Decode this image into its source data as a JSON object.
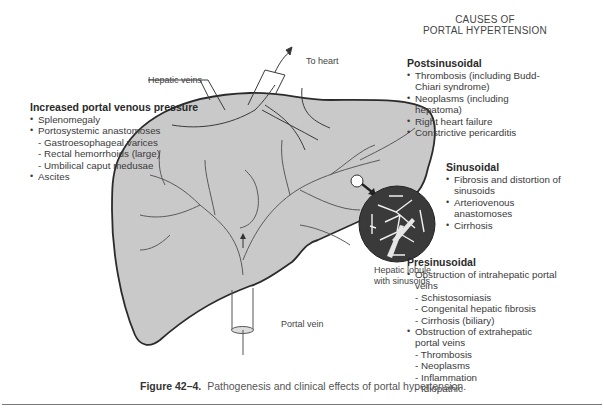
{
  "diagram": {
    "title_lines": [
      "CAUSES OF",
      "PORTAL HYPERTENSION"
    ],
    "labels": {
      "to_heart": "To heart",
      "hepatic_veins": "Hepatic veins",
      "portal_vein": "Portal vein",
      "hepatic_lobule_line1": "Hepatic lobule",
      "hepatic_lobule_line2": "with sinusoids"
    },
    "colors": {
      "liver_fill": "#c9c9c9",
      "liver_outline": "#2b2b2b",
      "vessel": "#555555",
      "lobule_fill": "#3a3a3a",
      "background": "#ffffff"
    }
  },
  "left_panel": {
    "heading": "Increased portal venous pressure",
    "items": [
      {
        "type": "bullet",
        "text": "Splenomegaly"
      },
      {
        "type": "bullet",
        "text": "Portosystemic anastomoses"
      },
      {
        "type": "sub",
        "text": "Gastroesophageal varices"
      },
      {
        "type": "sub",
        "text": "Rectal hemorrhoids (large)"
      },
      {
        "type": "sub",
        "text": "Umbilical caput medusae"
      },
      {
        "type": "bullet",
        "text": "Ascites"
      }
    ]
  },
  "postsinusoidal": {
    "heading": "Postsinusoidal",
    "items": [
      {
        "type": "bullet",
        "text": "Thrombosis (including Budd-Chiari syndrome)"
      },
      {
        "type": "bullet",
        "text": "Neoplasms (including hepatoma)"
      },
      {
        "type": "bullet",
        "text": "Right heart failure"
      },
      {
        "type": "bullet",
        "text": "Constrictive pericarditis"
      }
    ]
  },
  "sinusoidal": {
    "heading": "Sinusoidal",
    "items": [
      {
        "type": "bullet",
        "text": "Fibrosis and distortion of sinusoids"
      },
      {
        "type": "bullet",
        "text": "Arteriovenous anastomoses"
      },
      {
        "type": "bullet",
        "text": "Cirrhosis"
      }
    ]
  },
  "presinusoidal": {
    "heading": "Presinusoidal",
    "items": [
      {
        "type": "bullet",
        "text": "Obstruction of intrahepatic portal veins"
      },
      {
        "type": "sub",
        "text": "Schistosomiasis"
      },
      {
        "type": "sub",
        "text": "Congenital hepatic fibrosis"
      },
      {
        "type": "sub",
        "text": "Cirrhosis (biliary)"
      },
      {
        "type": "bullet",
        "text": "Obstruction of extrahepatic portal veins"
      },
      {
        "type": "sub",
        "text": "Thrombosis"
      },
      {
        "type": "sub",
        "text": "Neoplasms"
      },
      {
        "type": "sub",
        "text": "Inflammation"
      },
      {
        "type": "sub",
        "text": "Idiopathic"
      }
    ]
  },
  "caption": {
    "figure_label": "Figure 42–4.",
    "text": "Pathogenesis and clinical effects of portal hypertension."
  }
}
